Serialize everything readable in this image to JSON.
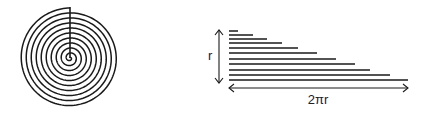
{
  "diagram": {
    "left": {
      "shape": "archimedean-spiral",
      "center": [
        70,
        58
      ],
      "outer_radius": 50,
      "turns": 10,
      "stroke": "#1a1a1a"
    },
    "right": {
      "shape": "stacked-lines-triangle",
      "left_x": 229,
      "line_ys": [
        31,
        35,
        39,
        43,
        48,
        53,
        59,
        64,
        70,
        75,
        80
      ],
      "line_right_xs": [
        238,
        253,
        267,
        282,
        298,
        317,
        336,
        355,
        370,
        390,
        408
      ],
      "stroke": "#1a1a1a"
    },
    "labels": {
      "height": "r",
      "width": "2πr"
    }
  }
}
